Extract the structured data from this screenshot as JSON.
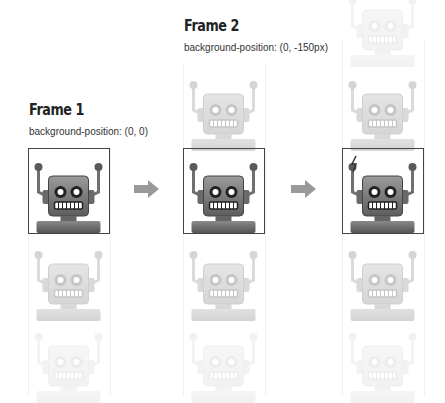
{
  "frames": [
    {
      "title": "Frame 1",
      "caption": "background-position: (0, 0)"
    },
    {
      "title": "Frame 2",
      "caption": "background-position: (0, -150px)"
    },
    {
      "title": "Frame 3",
      "caption": ""
    }
  ],
  "colors": {
    "robot_body": "#6f6f6f",
    "frame_border": "#444444",
    "arrow": "#9a9a9a",
    "title": "#222222"
  },
  "icons": {
    "arrow": "right-arrow-icon",
    "robot": "robot-sprite-icon",
    "spark": "lightning-icon"
  }
}
